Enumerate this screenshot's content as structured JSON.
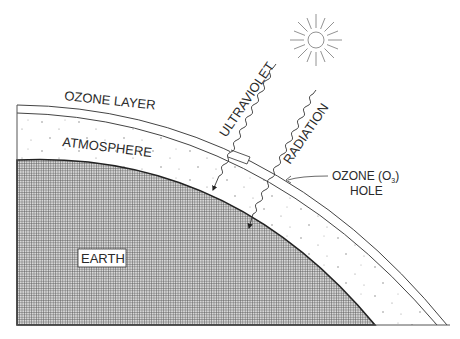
{
  "diagram": {
    "labels": {
      "ozone_layer": "OZONE LAYER",
      "atmosphere": "ATMOSPHERE",
      "earth": "EARTH",
      "ultraviolet": "ULTRAVIOLET",
      "radiation": "RADIATION",
      "ozone_hole_line1": "OZONE (O",
      "ozone_hole_sub": "3",
      "ozone_hole_close": ")",
      "ozone_hole_line2": "HOLE"
    },
    "colors": {
      "line": "#333333",
      "earth_fill": "#9a9a9a",
      "background": "#ffffff"
    }
  }
}
